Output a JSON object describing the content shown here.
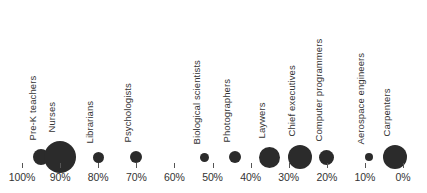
{
  "chart_data": {
    "type": "scatter",
    "title": "",
    "subtitle": "",
    "xlabel": "",
    "ylabel": "",
    "xlim": [
      100,
      0
    ],
    "x_axis_reversed": true,
    "grid": false,
    "legend": false,
    "legend_position": "none",
    "series_color": "#2b2b2b",
    "background_color": "#ffffff",
    "text_color": "#333333",
    "tick_labels": [
      "100%",
      "90%",
      "80%",
      "70%",
      "60%",
      "50%",
      "40%",
      "30%",
      "20%",
      "10%",
      "0%"
    ],
    "tick_values": [
      100,
      90,
      80,
      70,
      60,
      50,
      40,
      30,
      20,
      10,
      0
    ],
    "categories": [
      "Pre-K teachers",
      "Nurses",
      "Librarians",
      "Psychologists",
      "Biological scientists",
      "Photographers",
      "Laywers",
      "Chief executives",
      "Computer programmers",
      "Aerospace engineers",
      "Carpenters"
    ],
    "points": [
      {
        "label": "Pre-K teachers",
        "x": 95,
        "size": 16
      },
      {
        "label": "Nurses",
        "x": 90,
        "size": 32
      },
      {
        "label": "Librarians",
        "x": 80,
        "size": 11
      },
      {
        "label": "Psychologists",
        "x": 70,
        "size": 12
      },
      {
        "label": "Biological scientists",
        "x": 52,
        "size": 9
      },
      {
        "label": "Photographers",
        "x": 44,
        "size": 12
      },
      {
        "label": "Laywers",
        "x": 35,
        "size": 21
      },
      {
        "label": "Chief executives",
        "x": 27,
        "size": 24
      },
      {
        "label": "Computer programmers",
        "x": 20,
        "size": 15
      },
      {
        "label": "Aerospace engineers",
        "x": 9,
        "size": 8
      },
      {
        "label": "Carpenters",
        "x": 2,
        "size": 24
      }
    ]
  }
}
